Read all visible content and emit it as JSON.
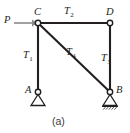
{
  "figure": {
    "caption": "(a)",
    "type": "truss-free-body-diagram",
    "width": 130,
    "height": 133,
    "background_color": "#ffffff",
    "line_color": "#231f20",
    "arrow_color": "#7f7f7f",
    "nodes": [
      {
        "id": "C",
        "label": "C",
        "x": 38,
        "y": 23,
        "marker": "open-circle"
      },
      {
        "id": "D",
        "label": "D",
        "x": 110,
        "y": 23,
        "marker": "open-circle"
      },
      {
        "id": "A",
        "label": "A",
        "x": 38,
        "y": 92,
        "marker": "open-circle",
        "support": "pin"
      },
      {
        "id": "B",
        "label": "B",
        "x": 110,
        "y": 92,
        "marker": "open-circle",
        "support": "pin-hatched-ground"
      }
    ],
    "members": [
      {
        "id": "T1",
        "label": "T",
        "subscript": "1",
        "from": "C",
        "to": "A",
        "orientation": "vertical"
      },
      {
        "id": "T2",
        "label": "T",
        "subscript": "2",
        "from": "C",
        "to": "D",
        "orientation": "horizontal"
      },
      {
        "id": "T3",
        "label": "T",
        "subscript": "3",
        "from": "D",
        "to": "B",
        "orientation": "vertical"
      },
      {
        "id": "T4",
        "label": "T",
        "subscript": "4",
        "from": "C",
        "to": "B",
        "orientation": "diagonal"
      }
    ],
    "loads": [
      {
        "id": "P",
        "label": "P",
        "applied_at": "C",
        "direction": "rightward-horizontal",
        "style": "arrow"
      }
    ]
  }
}
